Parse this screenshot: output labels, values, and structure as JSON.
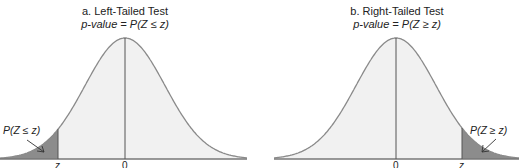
{
  "panels": [
    {
      "title": "a. Left-Tailed Test",
      "formula_prefix": "p",
      "formula_rest": "-value = P(Z ≤ z)",
      "area_label": "P(Z ≤ z)",
      "ticks": {
        "z": "z",
        "zero": "0"
      }
    },
    {
      "title": "b. Right-Tailed Test",
      "formula_prefix": "p",
      "formula_rest": "-value = P(Z ≥ z)",
      "area_label": "P(Z ≥ z)",
      "ticks": {
        "z": "z",
        "zero": "0"
      }
    }
  ],
  "colors": {
    "curve": "#8a8a8a",
    "body_fill": "#f1f1f1",
    "tail_fill": "#8c8c8c",
    "line": "#555555",
    "baseline": "#777777"
  }
}
